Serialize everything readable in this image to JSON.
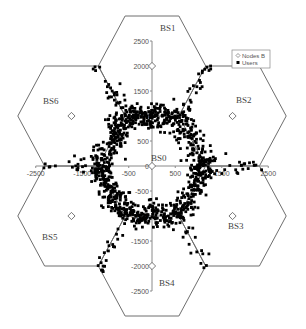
{
  "chart_data": {
    "type": "scatter",
    "title": "",
    "xlabel": "",
    "ylabel": "",
    "xlim": [
      -2500,
      2500
    ],
    "ylim": [
      -2500,
      2500
    ],
    "grid": false,
    "legend_position": "top-right",
    "x_ticks": [
      -2500,
      -1500,
      -500,
      500,
      1500,
      2500
    ],
    "x_tick_labels": [
      "-2500",
      "-1500",
      "-500",
      "500",
      "1500",
      "2500"
    ],
    "y_ticks": [
      2500,
      2000,
      1500,
      1000,
      500,
      0,
      -500,
      -1000,
      -1500,
      -2000,
      -2500
    ],
    "y_tick_labels": [
      "2500",
      "2000",
      "1500",
      "1000",
      "500",
      "0",
      "-500",
      "-1000",
      "-1500",
      "-2000",
      "-2500"
    ],
    "legend": [
      {
        "label": "Nodes B",
        "marker": "open-diamond"
      },
      {
        "label": "Users",
        "marker": "filled-square"
      }
    ],
    "base_stations": [
      {
        "name": "BS0",
        "x": 0,
        "y": 0
      },
      {
        "name": "BS1",
        "x": 0,
        "y": 2000
      },
      {
        "name": "BS2",
        "x": 1732,
        "y": 1000
      },
      {
        "name": "BS3",
        "x": 1732,
        "y": -1000
      },
      {
        "name": "BS4",
        "x": 0,
        "y": -2000
      },
      {
        "name": "BS5",
        "x": -1732,
        "y": -1000
      },
      {
        "name": "BS6",
        "x": -1732,
        "y": 1000
      }
    ],
    "cell_circumradius": 1155,
    "series": [
      {
        "name": "Nodes B",
        "marker": "open-diamond",
        "points": [
          [
            0,
            0
          ],
          [
            0,
            2000
          ],
          [
            1732,
            1000
          ],
          [
            1732,
            -1000
          ],
          [
            0,
            -2000
          ],
          [
            -1732,
            -1000
          ],
          [
            -1732,
            1000
          ]
        ]
      },
      {
        "name": "Users",
        "marker": "filled-square",
        "distribution": "clustered along the BS0 hexagonal cell boundary (radius ~1155) with spread ~±250, plus sparse scatter extending along the six inter-cell edges out to ~2400",
        "approx_count": 1100
      }
    ]
  },
  "labels": {
    "bs0": "BS0",
    "bs1": "BS1",
    "bs2": "BS2",
    "bs3": "BS3",
    "bs4": "BS4",
    "bs5": "BS5",
    "bs6": "BS6",
    "legend_nodes": "Nodes B",
    "legend_users": "Users"
  },
  "users_gen": {
    "seed": 7,
    "ring_count": 950,
    "ring_spread": 230,
    "spoke_count": 150,
    "spoke_spread": 90
  }
}
